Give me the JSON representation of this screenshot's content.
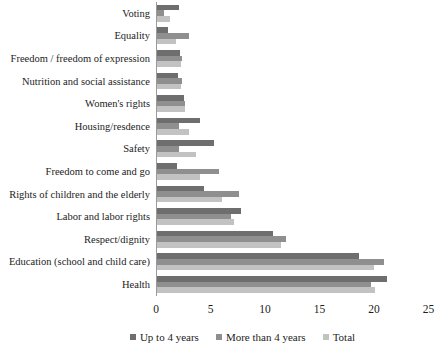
{
  "chart_data": {
    "type": "bar",
    "orientation": "horizontal",
    "title": "",
    "xlabel": "",
    "ylabel": "",
    "xlim": [
      0,
      25
    ],
    "x_ticks": [
      "0",
      "5",
      "10",
      "15",
      "20",
      "25"
    ],
    "grid": false,
    "legend_position": "bottom",
    "categories": [
      "Voting",
      "Equality",
      "Freedom / freedom of expression",
      "Nutrition and social assistance",
      "Women's rights",
      "Housing/resdence",
      "Safety",
      "Freedom to come and go",
      "Rights of children and the elderly",
      "Labor and labor rights",
      "Respect/dignity",
      "Education (school and child care)",
      "Health"
    ],
    "series": [
      {
        "name": "Up to 4 years",
        "color": "#6e6e6e",
        "values": [
          2.0,
          1.0,
          2.1,
          1.9,
          2.5,
          3.9,
          5.2,
          1.8,
          4.3,
          7.7,
          10.6,
          18.5,
          21.1
        ]
      },
      {
        "name": "More than 4 years",
        "color": "#8f8f8f",
        "values": [
          0.6,
          2.9,
          2.3,
          2.3,
          2.6,
          2.0,
          2.0,
          5.7,
          7.5,
          6.8,
          11.8,
          20.8,
          19.6
        ]
      },
      {
        "name": "Total",
        "color": "#c2c2c2",
        "values": [
          1.2,
          1.7,
          2.2,
          2.2,
          2.6,
          2.9,
          3.6,
          3.9,
          6.0,
          7.1,
          11.4,
          19.9,
          20.0
        ]
      }
    ]
  }
}
